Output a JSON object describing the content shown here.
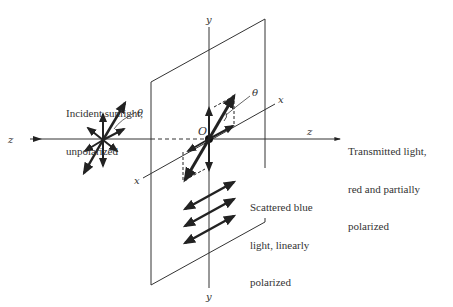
{
  "diagram": {
    "labels": {
      "incident": [
        "Incident sunlight,",
        "unpolarized"
      ],
      "transmitted": [
        "Transmitted light,",
        "red and partially",
        "polarized"
      ],
      "scattered": [
        "Scattered blue",
        "light, linearly",
        "polarized"
      ],
      "origin": "O",
      "theta_left": "θ",
      "theta_right": "θ",
      "axis_z_left": "z",
      "axis_z_right": "z",
      "axis_y_top": "y",
      "axis_y_bottom": "y",
      "axis_x_front": "x",
      "axis_x_back": "x"
    },
    "colors": {
      "ink": "#333333",
      "background": "#ffffff"
    }
  }
}
